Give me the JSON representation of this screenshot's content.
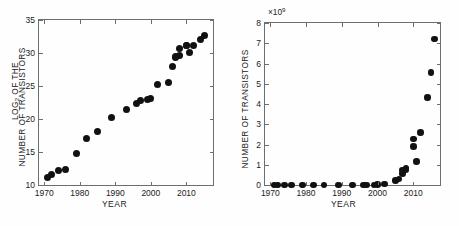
{
  "figure": {
    "background": "#ffffff",
    "marker_color": "#111111",
    "frame_color": "#6e6e6e"
  },
  "chart_data": [
    {
      "id": "left",
      "type": "scatter",
      "title": "",
      "xlabel": "YEAR",
      "ylabel": "LOG2 OF THE NUMBER OF TRANSISTORS",
      "ylabel_line1": "LOG",
      "ylabel_line1_sub": "2",
      "ylabel_line1_rest": " OF THE",
      "ylabel_line2": "NUMBER OF TRANSISTORS",
      "xlim": [
        1968.5,
        2017.5
      ],
      "ylim": [
        10,
        35
      ],
      "xticks": [
        1970,
        1980,
        1990,
        2000,
        2010
      ],
      "xticklabels": [
        "1970",
        "1980",
        "1990",
        "2000",
        "2010"
      ],
      "yticks": [
        10,
        15,
        20,
        25,
        30,
        35
      ],
      "yticklabels": [
        "10",
        "15",
        "20",
        "25",
        "30",
        "35"
      ],
      "grid": false,
      "legend": "none",
      "x": [
        1971,
        1972,
        1974,
        1976,
        1979,
        1982,
        1985,
        1989,
        1993,
        1996,
        1997,
        1999,
        2000,
        2002,
        2005,
        2006,
        2007,
        2007,
        2008,
        2008,
        2010,
        2010,
        2011,
        2012,
        2014,
        2015
      ],
      "y": [
        11.2,
        11.6,
        12.2,
        12.3,
        14.8,
        17.1,
        18.1,
        20.2,
        21.5,
        22.4,
        22.8,
        22.9,
        23.1,
        25.3,
        25.6,
        28.0,
        29.3,
        29.5,
        29.6,
        30.7,
        31.1,
        31.2,
        30.1,
        31.2,
        32.1,
        32.7
      ]
    },
    {
      "id": "right",
      "type": "scatter",
      "title": "",
      "xlabel": "YEAR",
      "ylabel": "NUMBER OF TRANSISTORS",
      "y_offset_text": "×10",
      "y_offset_exponent": "9",
      "xlim": [
        1968.5,
        2017.5
      ],
      "ylim": [
        0,
        8
      ],
      "ylim_units": "billions",
      "xticks": [
        1970,
        1980,
        1990,
        2000,
        2010
      ],
      "xticklabels": [
        "1970",
        "1980",
        "1990",
        "2000",
        "2010"
      ],
      "yticks": [
        0,
        1,
        2,
        3,
        4,
        5,
        6,
        7,
        8
      ],
      "yticklabels": [
        "0",
        "1",
        "2",
        "3",
        "4",
        "5",
        "6",
        "7",
        "8"
      ],
      "grid": false,
      "legend": "none",
      "x": [
        1971,
        1972,
        1974,
        1976,
        1979,
        1982,
        1985,
        1989,
        1993,
        1996,
        1997,
        1999,
        2000,
        2002,
        2005,
        2006,
        2007,
        2007,
        2008,
        2008,
        2010,
        2010,
        2011,
        2012,
        2014,
        2015,
        2016
      ],
      "y": [
        2.4e-06,
        3.5e-06,
        6e-06,
        6.5e-06,
        2.9e-05,
        0.000134,
        0.000275,
        0.0012,
        0.0031,
        0.0055,
        0.0075,
        0.0095,
        0.011,
        0.042,
        0.23,
        0.291,
        0.582,
        0.731,
        0.758,
        0.805,
        1.9,
        2.27,
        1.17,
        2.6,
        4.31,
        5.56,
        7.2
      ]
    }
  ]
}
